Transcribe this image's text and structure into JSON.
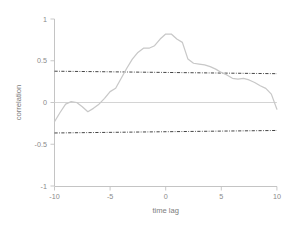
{
  "chart_data": {
    "type": "line",
    "title": "",
    "xlabel": "time lag",
    "ylabel": "correlation",
    "xlim": [
      -10,
      10
    ],
    "ylim": [
      -1,
      1
    ],
    "grid": false,
    "legend": null,
    "x_ticks": [
      -10,
      -5,
      0,
      5,
      10
    ],
    "x_tick_labels": [
      "-10",
      "-5",
      "0",
      "5",
      "10"
    ],
    "y_ticks": [
      -1,
      -0.5,
      0,
      0.5,
      1
    ],
    "y_tick_labels": [
      "-1",
      "-0.5",
      "0",
      "0.5",
      "1"
    ],
    "series": [
      {
        "name": "cross-correlation",
        "style": "solid",
        "color": "#c8c8c8",
        "x": [
          -10,
          -9.5,
          -9,
          -8.5,
          -8,
          -7.5,
          -7,
          -6.5,
          -6,
          -5.5,
          -5,
          -4.5,
          -4,
          -3.5,
          -3,
          -2.5,
          -2,
          -1.5,
          -1,
          -0.5,
          0,
          0.5,
          1,
          1.5,
          2,
          2.5,
          3,
          3.5,
          4,
          4.5,
          5,
          5.5,
          6,
          6.5,
          7,
          7.5,
          8,
          8.5,
          9,
          9.5,
          10
        ],
        "values": [
          -0.23,
          -0.12,
          -0.02,
          0.01,
          0.0,
          -0.05,
          -0.11,
          -0.07,
          -0.02,
          0.05,
          0.13,
          0.17,
          0.29,
          0.41,
          0.52,
          0.6,
          0.65,
          0.65,
          0.68,
          0.76,
          0.82,
          0.82,
          0.76,
          0.72,
          0.52,
          0.47,
          0.46,
          0.45,
          0.43,
          0.4,
          0.36,
          0.33,
          0.29,
          0.28,
          0.29,
          0.27,
          0.24,
          0.2,
          0.17,
          0.1,
          -0.08
        ]
      },
      {
        "name": "upper confidence bound",
        "style": "dash-dot",
        "color": "#3a3a3a",
        "x": [
          -10,
          10
        ],
        "values": [
          0.375,
          0.345
        ]
      },
      {
        "name": "lower confidence bound",
        "style": "dash-dot",
        "color": "#3a3a3a",
        "x": [
          -10,
          10
        ],
        "values": [
          -0.365,
          -0.335
        ]
      },
      {
        "name": "zero reference",
        "style": "solid-thin",
        "color": "#cfcfcf",
        "x": [
          -10,
          10
        ],
        "values": [
          0,
          0
        ]
      }
    ],
    "colors": {
      "data": "#c8c8c8",
      "confidence": "#3a3a3a",
      "axis": "#bdbdbd",
      "text": "#8a8a8a",
      "background": "#ffffff"
    }
  }
}
